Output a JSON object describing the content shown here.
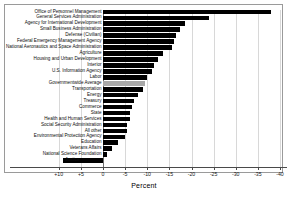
{
  "chart_data": {
    "type": "bar",
    "orientation": "horizontal",
    "title": "",
    "xlabel": "Percent",
    "ylabel": "",
    "xlim": [
      12,
      -41
    ],
    "xticks": [
      10,
      5,
      0,
      -5,
      -10,
      -15,
      -20,
      -25,
      -30,
      -35,
      -40
    ],
    "xticklabels": [
      "+10",
      "+5",
      "0",
      "-5",
      "-10",
      "-15",
      "-20",
      "-25",
      "-30",
      "-35",
      "-40"
    ],
    "grid": true,
    "legend": "none",
    "colors": {
      "bar": "#000000",
      "average_bar": "#a8a8a8",
      "grid": "#d8d8d8",
      "axis": "#4a4a4a",
      "frame": "#9a9a9a",
      "background": "#ffffff"
    },
    "categories": [
      "Office of Personnel Management",
      "General Services Administration",
      "Agency for International Development",
      "Small Business Administration",
      "Defense (Civilian)",
      "Federal Emergency Management Agency",
      "National Aeronautics and Space Administration",
      "Agriculture",
      "Housing and Urban Development",
      "Interior",
      "U.S. Information Agency",
      "Labor",
      "Governmentwide Average",
      "Transportation",
      "Energy",
      "Treasury",
      "Commerce",
      "State",
      "Health and Human Services",
      "Social Security Administration",
      "All other",
      "Environmental Protection Agency",
      "Education",
      "Veterans Affairs",
      "National Science Foundation",
      "Justice"
    ],
    "values": [
      -38.0,
      -24.0,
      -18.5,
      -17.5,
      -16.5,
      -16.0,
      -15.5,
      -13.5,
      -12.5,
      -11.5,
      -11.0,
      -10.0,
      -9.5,
      -9.0,
      -8.0,
      -7.0,
      -6.5,
      -6.0,
      -6.0,
      -5.5,
      -5.5,
      -5.0,
      -3.5,
      -2.0,
      -0.8,
      9.0
    ],
    "highlight_category": "Governmentwide Average"
  }
}
